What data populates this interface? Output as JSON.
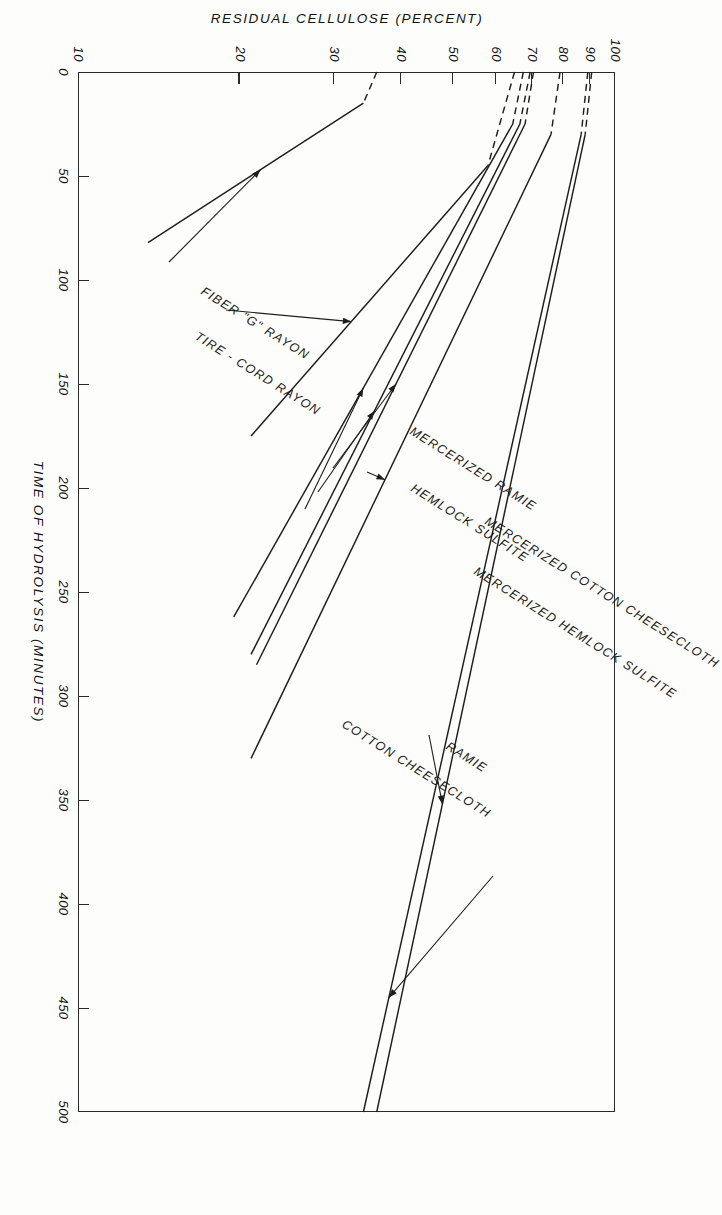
{
  "figure": {
    "background": "#fdfdfb",
    "ink": "#1d1d1d"
  },
  "chart_data": {
    "type": "line",
    "title": "",
    "xlabel": "TIME OF HYDROLYSIS (MINUTES)",
    "ylabel": "RESIDUAL CELLULOSE (PERCENT)",
    "xlim": [
      0,
      500
    ],
    "ylim": [
      10,
      100
    ],
    "yscale": "log",
    "xscale": "linear",
    "grid": false,
    "legend_position": "inline-annotations",
    "xticks": [
      0,
      50,
      100,
      150,
      200,
      250,
      300,
      350,
      400,
      450,
      500
    ],
    "xtick_labels": [
      "0",
      "50",
      "100",
      "150",
      "200",
      "250",
      "300",
      "350",
      "400",
      "450",
      "500"
    ],
    "yticks": [
      100,
      90,
      80,
      70,
      60,
      50,
      40,
      30,
      20,
      10
    ],
    "ytick_labels": [
      "100",
      "90",
      "80",
      "70",
      "60",
      "50",
      "40",
      "30",
      "20",
      "10"
    ],
    "series": [
      {
        "name": "RAMIE",
        "solid_from": 30,
        "dashed_to": 30,
        "points": [
          [
            0,
            90.5
          ],
          [
            30,
            88.0
          ],
          [
            500,
            36.0
          ]
        ]
      },
      {
        "name": "COTTON CHEESECLOTH",
        "solid_from": 30,
        "dashed_to": 30,
        "points": [
          [
            0,
            89.0
          ],
          [
            30,
            86.5
          ],
          [
            500,
            34.0
          ]
        ]
      },
      {
        "name": "MERCERIZED RAMIE",
        "solid_from": 30,
        "dashed_to": 30,
        "points": [
          [
            0,
            79.0
          ],
          [
            30,
            76.0
          ],
          [
            330,
            21.0
          ]
        ]
      },
      {
        "name": "HEMLOCK SULFITE",
        "solid_from": 25,
        "dashed_to": 25,
        "points": [
          [
            0,
            70.5
          ],
          [
            25,
            68.0
          ],
          [
            285,
            21.5
          ]
        ]
      },
      {
        "name": "MERCERIZED COTTON CHEESECLOTH",
        "solid_from": 25,
        "dashed_to": 25,
        "points": [
          [
            0,
            69.5
          ],
          [
            25,
            66.5
          ],
          [
            280,
            21.0
          ]
        ]
      },
      {
        "name": "MERCERIZED HEMLOCK SULFITE",
        "solid_from": 25,
        "dashed_to": 25,
        "points": [
          [
            0,
            67.5
          ],
          [
            25,
            64.5
          ],
          [
            262,
            19.5
          ]
        ]
      },
      {
        "name": "FIBER \"G\" RAYON",
        "solid_from": 45,
        "dashed_to": 45,
        "points": [
          [
            0,
            65.0
          ],
          [
            45,
            58.0
          ],
          [
            175,
            21.0
          ]
        ]
      },
      {
        "name": "TIRE - CORD RAYON",
        "solid_from": 15,
        "dashed_to": 15,
        "points": [
          [
            0,
            36.0
          ],
          [
            15,
            34.0
          ],
          [
            82,
            13.5
          ]
        ]
      }
    ],
    "annotations": [
      {
        "label": "RAMIE"
      },
      {
        "label": "COTTON CHEESECLOTH"
      },
      {
        "label": "MERCERIZED RAMIE"
      },
      {
        "label": "HEMLOCK SULFITE"
      },
      {
        "label": "MERCERIZED COTTON CHEESECLOTH"
      },
      {
        "label": "MERCERIZED HEMLOCK SULFITE"
      },
      {
        "label": "FIBER \"G\" RAYON"
      },
      {
        "label": "TIRE - CORD RAYON"
      }
    ]
  }
}
